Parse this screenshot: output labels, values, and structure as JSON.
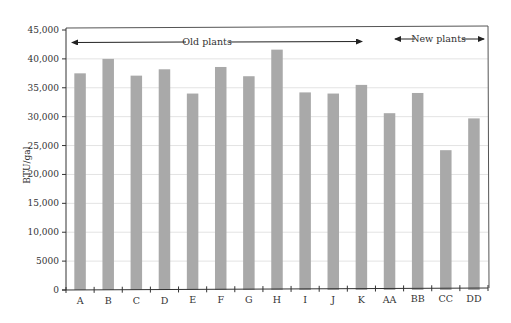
{
  "chart_data": {
    "type": "bar",
    "title": "",
    "xlabel": "",
    "ylabel": "BTU/gal",
    "ylim": [
      0,
      45000
    ],
    "yticks": [
      0,
      5000,
      10000,
      15000,
      20000,
      25000,
      30000,
      35000,
      40000,
      45000
    ],
    "ytick_labels": [
      "0",
      "5000",
      "10,000",
      "15,000",
      "20,000",
      "25,000",
      "30,000",
      "35,000",
      "40,000",
      "45,000"
    ],
    "grid": true,
    "legend": null,
    "categories": [
      "A",
      "B",
      "C",
      "D",
      "E",
      "F",
      "G",
      "H",
      "I",
      "J",
      "K",
      "AA",
      "BB",
      "CC",
      "DD"
    ],
    "values": [
      37500,
      40000,
      37100,
      38200,
      34000,
      38600,
      37000,
      41600,
      34200,
      34000,
      35500,
      30600,
      34100,
      24200,
      29700
    ],
    "bar_color": "#a9a9a9",
    "annotations": [
      {
        "text": "Old plants",
        "spans": [
          "A",
          "K"
        ],
        "arrows": "both"
      },
      {
        "text": "New plants",
        "spans": [
          "AA",
          "DD"
        ],
        "arrows": "both"
      }
    ]
  }
}
